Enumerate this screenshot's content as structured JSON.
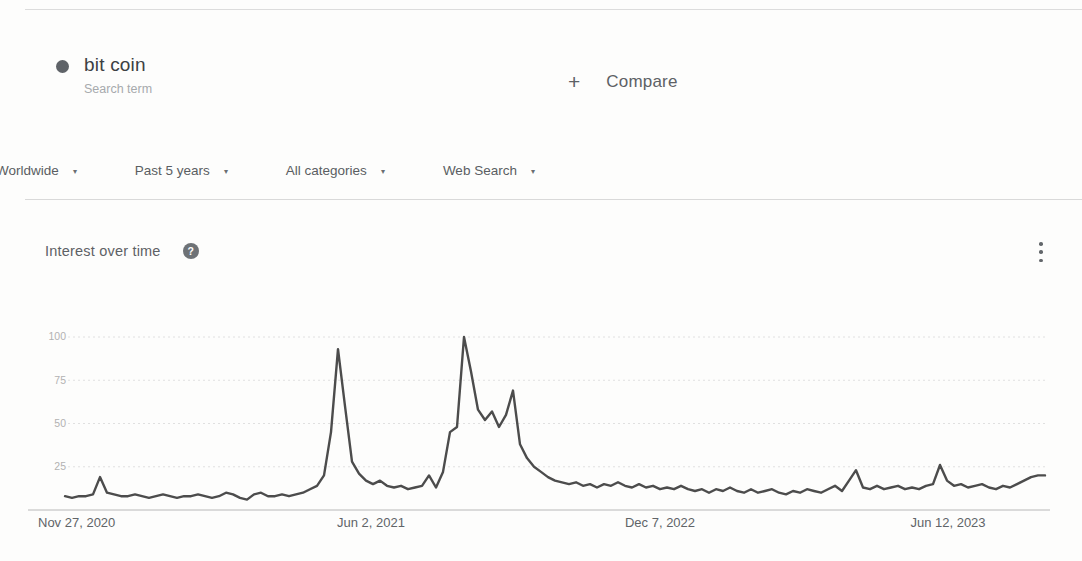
{
  "header": {
    "term": {
      "title": "bit coin",
      "subtitle": "Search term",
      "color": "#5f6368"
    },
    "compare": {
      "plus": "+",
      "label": "Compare"
    }
  },
  "filters": [
    {
      "label": "Worldwide",
      "chevron": "▾"
    },
    {
      "label": "Past 5 years",
      "chevron": "▾"
    },
    {
      "label": "All categories",
      "chevron": "▾"
    },
    {
      "label": "Web Search",
      "chevron": "▾"
    }
  ],
  "section": {
    "title": "Interest over time",
    "help_glyph": "?"
  },
  "chart_data": {
    "type": "line",
    "title": "Interest over time",
    "series_name": "bit coin",
    "xlabel": "",
    "ylabel": "Interest (0-100)",
    "ylim": [
      0,
      100
    ],
    "grid": "dotted horizontal lines at 25/50/75/100",
    "legend": "none",
    "line_color": "#4c4c4c",
    "x_tick_labels": [
      "Nov 27, 2020",
      "Jun 2, 2021",
      "Dec 7, 2022",
      "Jun 12, 2023"
    ],
    "y_ticks": [
      100,
      75,
      50,
      25
    ],
    "values": [
      8,
      7,
      8,
      8,
      9,
      19,
      10,
      9,
      8,
      8,
      9,
      8,
      7,
      8,
      9,
      8,
      7,
      8,
      8,
      9,
      8,
      7,
      8,
      10,
      9,
      7,
      6,
      9,
      10,
      8,
      8,
      9,
      8,
      9,
      10,
      12,
      14,
      20,
      45,
      93,
      60,
      28,
      21,
      17,
      15,
      17,
      14,
      13,
      14,
      12,
      13,
      14,
      20,
      13,
      22,
      45,
      48,
      100,
      80,
      58,
      52,
      57,
      48,
      55,
      69,
      38,
      30,
      25,
      22,
      19,
      17,
      16,
      15,
      16,
      14,
      15,
      13,
      15,
      14,
      16,
      14,
      13,
      15,
      13,
      14,
      12,
      13,
      12,
      14,
      12,
      11,
      12,
      10,
      12,
      11,
      13,
      11,
      10,
      12,
      10,
      11,
      12,
      10,
      9,
      11,
      10,
      12,
      11,
      10,
      12,
      14,
      11,
      17,
      23,
      13,
      12,
      14,
      12,
      13,
      14,
      12,
      13,
      12,
      14,
      15,
      26,
      17,
      14,
      15,
      13,
      14,
      15,
      13,
      12,
      14,
      13,
      15,
      17,
      19,
      20,
      20
    ]
  }
}
